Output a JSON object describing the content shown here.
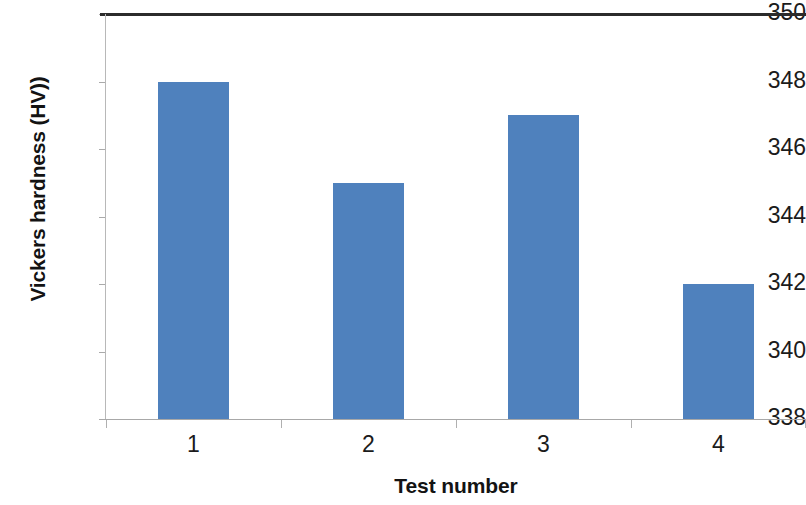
{
  "chart_data": {
    "type": "bar",
    "title": "",
    "subtitle": "",
    "xlabel": "Test number",
    "ylabel": "Vickers hardness (HV))",
    "categories": [
      "1",
      "2",
      "3",
      "4"
    ],
    "values": [
      348,
      345,
      347,
      342
    ],
    "series": [
      {
        "name": "Vickers hardness",
        "values": [
          348,
          345,
          347,
          342
        ],
        "color": "#4f81bd"
      }
    ],
    "ylim": [
      338,
      350
    ],
    "ytick_labels": [
      "350",
      "348",
      "346",
      "344",
      "342",
      "340",
      "338"
    ],
    "ytick_values": [
      350,
      348,
      346,
      344,
      342,
      340,
      338
    ],
    "ytick_step": 2,
    "xtick_labels": [
      "1",
      "2",
      "3",
      "4"
    ],
    "grid": false,
    "legend": false,
    "legend_position": "none",
    "bar_color": "#4f81bd",
    "axis_color": "#a8a8a8",
    "top_border_color": "#2b2b2b",
    "background_color": "#ffffff",
    "annotations": []
  }
}
